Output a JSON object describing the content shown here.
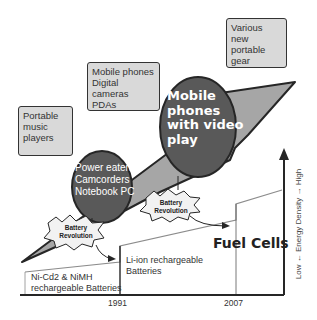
{
  "boxes": {
    "music": {
      "lines": [
        "Portable",
        "music",
        "players"
      ]
    },
    "mobile": {
      "lines": [
        "Mobile phones",
        "Digital cameras",
        "PDAs"
      ]
    },
    "gear": {
      "lines": [
        "Various new",
        "portable",
        "gear"
      ]
    }
  },
  "circles": {
    "power": {
      "lines": [
        "Power eaters:",
        "Camcorders",
        "Notebook PC"
      ]
    },
    "video": {
      "lines": [
        "Mobile",
        "phones",
        "with video",
        "play"
      ]
    }
  },
  "bursts": {
    "first": {
      "lines": [
        "Battery",
        "Revolution"
      ]
    },
    "second": {
      "lines": [
        "Battery",
        "Revolution"
      ]
    }
  },
  "steps": {
    "nicd": {
      "lines": [
        "Ni-Cd2 & NiMH",
        "rechargeable Batteries"
      ]
    },
    "liion": {
      "lines": [
        "Li-ion rechargeable",
        "Batteries"
      ]
    },
    "fuel": {
      "label": "Fuel Cells"
    }
  },
  "axis": {
    "x_ticks": [
      "1991",
      "2007"
    ],
    "y_label": "Low ← Energy Density → High"
  },
  "colors": {
    "box_fill": "#d9d9d9",
    "arrow_fill": "#a6a6a6",
    "circle_fill": "#595959",
    "stroke": "#262626",
    "step_line": "#8c8c8c"
  }
}
